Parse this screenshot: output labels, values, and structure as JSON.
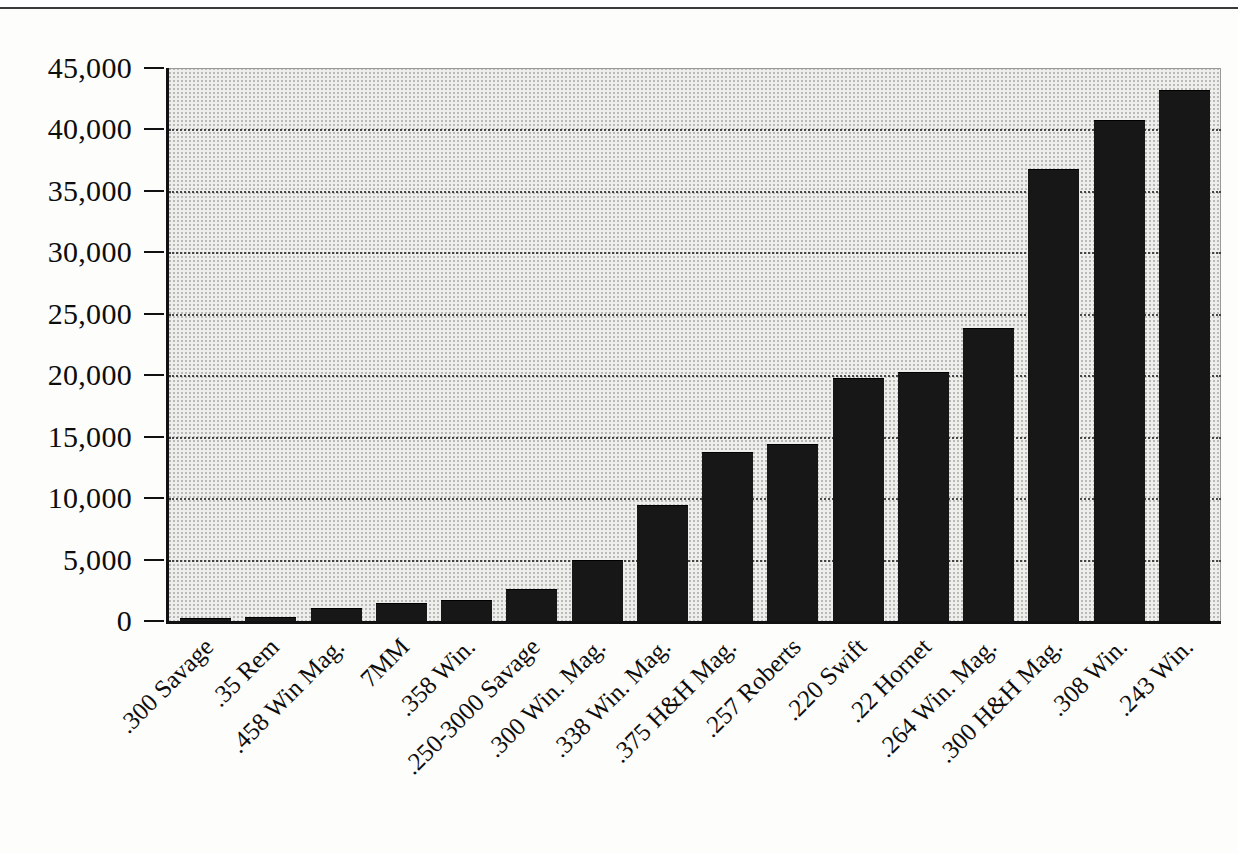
{
  "chart_data": {
    "type": "bar",
    "title": "",
    "xlabel": "",
    "ylabel": "",
    "ylim": [
      0,
      45000
    ],
    "grid": true,
    "legend": null,
    "categories": [
      ".300 Savage",
      ".35 Rem",
      ".458 Win Mag.",
      "7MM",
      ".358 Win.",
      ".250-3000 Savage",
      ".300 Win. Mag.",
      ".338 Win. Mag.",
      ".375 H&H Mag.",
      ".257 Roberts",
      ".220 Swift",
      ".22 Hornet",
      ".264 Win. Mag.",
      ".300 H&H Mag.",
      ".308 Win.",
      ".243 Win."
    ],
    "values": [
      200,
      280,
      1000,
      1350,
      1600,
      2500,
      4850,
      9400,
      13700,
      14300,
      19700,
      20150,
      23800,
      36700,
      40700,
      43100
    ],
    "y_ticks": [
      0,
      5000,
      10000,
      15000,
      20000,
      25000,
      30000,
      35000,
      40000,
      45000
    ],
    "y_tick_labels": [
      "0",
      "5,000",
      "10,000",
      "15,000",
      "20,000",
      "25,000",
      "30,000",
      "35,000",
      "40,000",
      "45,000"
    ],
    "colors": {
      "bar": "#171717",
      "plot_background": "#eeeeec",
      "gridline": "#2c2c2c",
      "axis": "#111111",
      "text": "#0d0d0d",
      "page_background": "#fdfdfb"
    }
  }
}
